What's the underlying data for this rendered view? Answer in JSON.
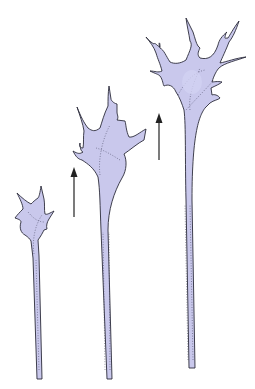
{
  "figure": {
    "colors": {
      "cytoplasm": "#c9c8ec",
      "outline": "#2b2b3a",
      "arrow": "#222222",
      "background": "#ffffff"
    },
    "stages": [
      {
        "label": "stage-1",
        "size": "small"
      },
      {
        "label": "stage-2",
        "size": "medium"
      },
      {
        "label": "stage-3",
        "size": "large"
      }
    ],
    "arrows": [
      {
        "direction": "up",
        "between": "stage-1 and stage-2"
      },
      {
        "direction": "up",
        "between": "stage-2 and stage-3"
      }
    ]
  }
}
